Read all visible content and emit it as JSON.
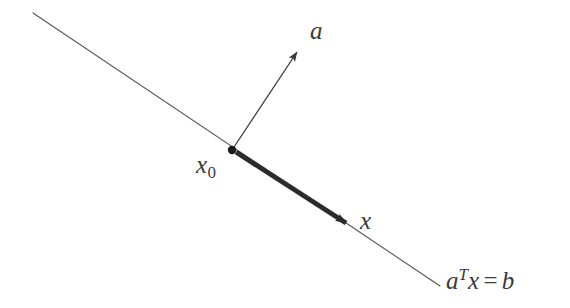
{
  "figure": {
    "background_color": "#ffffff",
    "labels": {
      "normal_vector": "a",
      "base_point_symbol": "x",
      "base_point_subscript": "0",
      "point_vector": "x",
      "hyperplane_equation_lhs": "a",
      "hyperplane_equation_transpose": "T",
      "hyperplane_equation_var": "x",
      "hyperplane_equation_operator": "=",
      "hyperplane_equation_rhs": "b"
    },
    "colors": {
      "hyperplane_line": "#555555",
      "normal_arrow": "#3a3a3a",
      "difference_vector": "#2b2b2b",
      "point_marker": "#1a1a1a",
      "text": "#3a3a3a"
    },
    "geometry": {
      "hyperplane_line": {
        "x1": 33,
        "y1": 13,
        "x2": 440,
        "y2": 286
      },
      "normal_arrow": {
        "x1": 232,
        "y1": 150,
        "x2": 300,
        "y2": 48
      },
      "difference_vector": {
        "x1": 236,
        "y1": 152,
        "x2": 352,
        "y2": 227
      },
      "base_point": {
        "cx": 232,
        "cy": 150,
        "r": 4.2
      }
    }
  }
}
